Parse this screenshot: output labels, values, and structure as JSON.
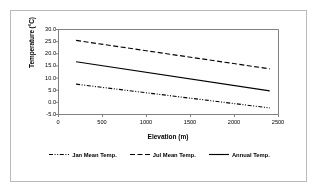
{
  "chart_data": {
    "type": "line",
    "title": "",
    "xlabel": "Elevation (m)",
    "ylabel": "Temperature (°C)",
    "xlim": [
      0,
      2500
    ],
    "ylim": [
      -5.0,
      30.0
    ],
    "xticks": [
      "0",
      "500",
      "1000",
      "1500",
      "2000",
      "2500"
    ],
    "xtick_values": [
      0,
      500,
      1000,
      1500,
      2000,
      2500
    ],
    "yticks": [
      "30.0",
      "25.0",
      "20.0",
      "15.0",
      "10.0",
      "5.0",
      "0.0",
      "-5.0"
    ],
    "ytick_values": [
      30.0,
      25.0,
      20.0,
      15.0,
      10.0,
      5.0,
      0.0,
      -5.0
    ],
    "grid": false,
    "legend_position": "bottom",
    "x": [
      200,
      2400
    ],
    "series": [
      {
        "name": "Jan Mean Temp.",
        "style": "dash-dot-dot",
        "color": "#000000",
        "values": [
          7.5,
          -2.3
        ]
      },
      {
        "name": "Jul Mean Temp.",
        "style": "dashed",
        "color": "#000000",
        "values": [
          25.5,
          13.8
        ]
      },
      {
        "name": "Annual Temp.",
        "style": "solid",
        "color": "#000000",
        "values": [
          16.7,
          4.7
        ]
      }
    ]
  },
  "legend": {
    "items": [
      {
        "label": "Jan Mean Temp."
      },
      {
        "label": "Jul Mean Temp."
      },
      {
        "label": "Annual Temp."
      }
    ]
  },
  "colors": {
    "line": "#000000",
    "axis": "#808080",
    "frame": "#b9b9b9",
    "background": "#ffffff"
  }
}
